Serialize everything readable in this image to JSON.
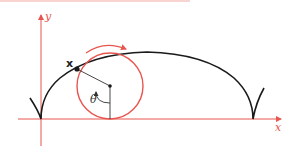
{
  "figure": {
    "axes": {
      "x_label": "x",
      "y_label": "y",
      "color": "#e8554e"
    },
    "curve": {
      "name": "cycloid",
      "color": "#1a1a1a"
    },
    "circle": {
      "color": "#e8554e",
      "rotation_direction": "clockwise"
    },
    "point_label": "x",
    "angle_label": "θ",
    "top_rule_color": "#f0a9a6"
  }
}
